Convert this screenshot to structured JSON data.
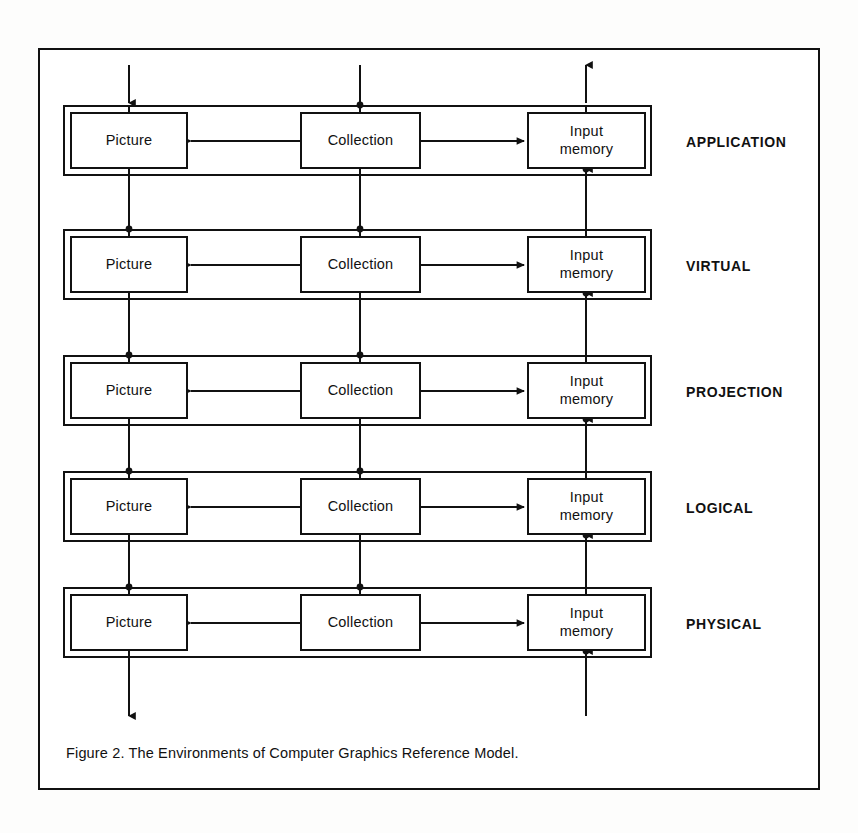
{
  "figure": {
    "caption": "Figure 2. The Environments of Computer Graphics Reference Model.",
    "frame_color": "#111111",
    "background_color": "#ffffff"
  },
  "nodes": {
    "picture_label": "Picture",
    "collection_label": "Collection",
    "input_memory_label_line1": "Input",
    "input_memory_label_line2": "memory"
  },
  "tiers": [
    {
      "name": "APPLICATION",
      "y": 105
    },
    {
      "name": "VIRTUAL",
      "y": 229
    },
    {
      "name": "PROJECTION",
      "y": 355
    },
    {
      "name": "LOGICAL",
      "y": 471
    },
    {
      "name": "PHYSICAL",
      "y": 587
    }
  ],
  "tier_labels": {
    "t0": "APPLICATION",
    "t1": "VIRTUAL",
    "t2": "PROJECTION",
    "t3": "LOGICAL",
    "t4": "PHYSICAL"
  },
  "connections": {
    "left_column_direction": "downward",
    "middle_column_direction": "downward",
    "right_column_direction": "upward",
    "collection_to_picture": "arrow-left",
    "collection_to_input_memory": "arrow-right",
    "top_left_arrow": "down",
    "top_right_arrow": "up",
    "bottom_left_arrow": "down"
  },
  "columns": {
    "picture_x": 129,
    "collection_x": 360,
    "input_memory_x": 586
  }
}
